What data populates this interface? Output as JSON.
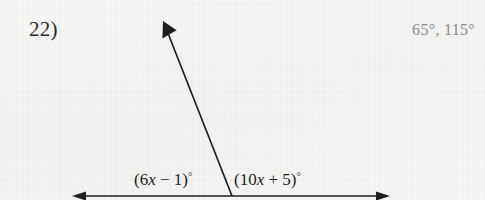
{
  "worksheet": {
    "problem_number": "22)",
    "answer": "65°, 115°",
    "ink_color": "#1f1f21",
    "answer_color": "#8d8d8f",
    "paper_color": "#f6f6f5"
  },
  "figure": {
    "type": "linear-pair-angle-diagram",
    "baseline": {
      "name": "horizontal-double-arrow",
      "x1": 72,
      "y1": 196,
      "x2": 390,
      "y2": 196,
      "arrowheads": "both"
    },
    "ray": {
      "name": "upward-ray",
      "vertex_x": 232,
      "vertex_y": 196,
      "tip_x": 163,
      "tip_y": 21,
      "arrowheads": "tip"
    },
    "labels": {
      "left": {
        "full": "(6x − 1)°",
        "prefix": "(6",
        "variable": "x",
        "operator": " − 1)",
        "degree": "°"
      },
      "right": {
        "full": "(10x + 5)°",
        "prefix": "(10",
        "variable": "x",
        "operator": " + 5)",
        "degree": "°"
      }
    }
  }
}
